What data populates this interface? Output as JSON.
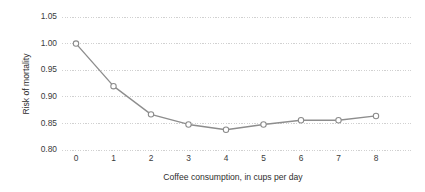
{
  "chart_data": {
    "type": "line",
    "title": "",
    "subtitle": "",
    "xlabel": "Coffee consumption, in cups per day",
    "ylabel": "Risk of mortality",
    "x": [
      0,
      1,
      2,
      3,
      4,
      5,
      6,
      7,
      8
    ],
    "values": [
      1.0,
      0.92,
      0.867,
      0.848,
      0.838,
      0.848,
      0.856,
      0.856,
      0.864
    ],
    "series": [
      {
        "name": "Risk of mortality",
        "values": [
          1.0,
          0.92,
          0.867,
          0.848,
          0.838,
          0.848,
          0.856,
          0.856,
          0.864
        ]
      }
    ],
    "xtick_labels": [
      "0",
      "1",
      "2",
      "3",
      "4",
      "5",
      "6",
      "7",
      "8"
    ],
    "ytick_labels": [
      "1.05",
      "1.00",
      "0.95",
      "0.90",
      "0.85",
      "0.80"
    ],
    "ytick_values": [
      1.05,
      1.0,
      0.95,
      0.9,
      0.85,
      0.8
    ],
    "xlim": [
      -0.45,
      8.9
    ],
    "ylim": [
      0.8,
      1.05
    ],
    "grid": "horizontal-dotted",
    "legend": "none",
    "marker": "open-circle",
    "colors": {
      "line": "#8d8d8d",
      "marker_fill": "#ffffff",
      "marker_stroke": "#8a8a8a",
      "gridline": "#c9c9c9",
      "text": "#3b3b3b",
      "background": "#ffffff"
    }
  }
}
